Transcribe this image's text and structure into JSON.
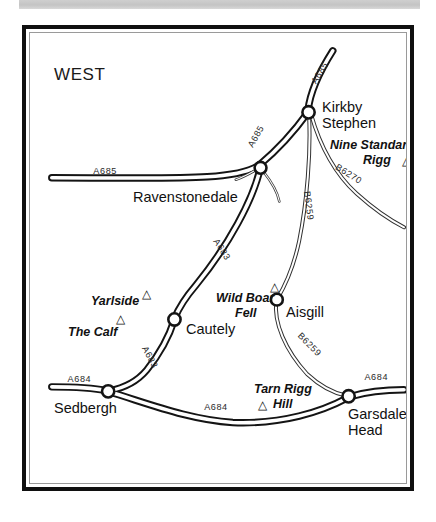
{
  "page": {
    "background_color": "#ffffff",
    "top_bar_color": "#c8c8c8",
    "frame_color": "#101010"
  },
  "map": {
    "orientation_heading": "WEST",
    "towns": [
      {
        "name": "Kirkby Stephen",
        "line1": "Kirkby",
        "line2": "Stephen",
        "x": 303,
        "y": 100
      },
      {
        "name": "Ravenstonedale",
        "line1": "Ravenstonedale",
        "line2": "",
        "x": 236,
        "y": 178
      },
      {
        "name": "Cautely",
        "line1": "Cautely",
        "line2": "",
        "x": 168,
        "y": 311
      },
      {
        "name": "Aisgill",
        "line1": "Aisgill",
        "line2": "",
        "x": 311,
        "y": 296
      },
      {
        "name": "Sedbergh",
        "line1": "Sedbergh",
        "line2": "",
        "x": 98,
        "y": 391
      },
      {
        "name": "Garsdale Head",
        "line1": "Garsdale",
        "line2": "Head",
        "x": 343,
        "y": 398
      }
    ],
    "hills": [
      {
        "name": "Nine Standards Rigg",
        "line1": "Nine Standards",
        "line2": "Rigg",
        "marker": "triangle"
      },
      {
        "name": "Yarlside",
        "line1": "Yarlside",
        "line2": "",
        "marker": "triangle"
      },
      {
        "name": "The Calf",
        "line1": "The Calf",
        "line2": "",
        "marker": "triangle"
      },
      {
        "name": "Wild Boar Fell",
        "line1": "Wild Boar",
        "line2": "Fell",
        "marker": "triangle"
      },
      {
        "name": "Tarn Rigg Hill",
        "line1": "Tarn Rigg",
        "line2": "Hill",
        "marker": "triangle"
      }
    ],
    "road_labels": [
      {
        "id": "a685-top",
        "text": "A685"
      },
      {
        "id": "a685-west",
        "text": "A685"
      },
      {
        "id": "a685-mid",
        "text": "A685"
      },
      {
        "id": "a683-upper",
        "text": "A683"
      },
      {
        "id": "a683-lower",
        "text": "A683"
      },
      {
        "id": "b6270",
        "text": "B6270"
      },
      {
        "id": "b6259-upper",
        "text": "B6259"
      },
      {
        "id": "b6259-lower",
        "text": "B6259"
      },
      {
        "id": "a684-west",
        "text": "A684"
      },
      {
        "id": "a684-south",
        "text": "A684"
      },
      {
        "id": "a684-east",
        "text": "A684"
      }
    ],
    "triangle_glyph": "△"
  }
}
